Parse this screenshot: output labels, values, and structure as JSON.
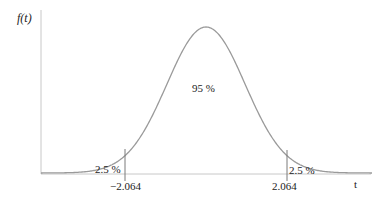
{
  "chart_data": {
    "type": "line",
    "title": "",
    "ylabel": "f(t)",
    "xlabel": "t",
    "distribution": "t-distribution (symmetric bell curve)",
    "annotations": {
      "center_area": "95 %",
      "left_tail_area": "2.5 %",
      "right_tail_area": "2.5 %"
    },
    "critical_values": {
      "lower": "−2.064",
      "upper": "2.064"
    },
    "x_ticks": [
      "−2.064",
      "2.064"
    ],
    "grid": false,
    "legend": null,
    "colors": {
      "curve": "#9a9a9a",
      "axes": "#c8c8c8",
      "critical_lines": "#7a7a7a",
      "text": "#222222"
    }
  }
}
